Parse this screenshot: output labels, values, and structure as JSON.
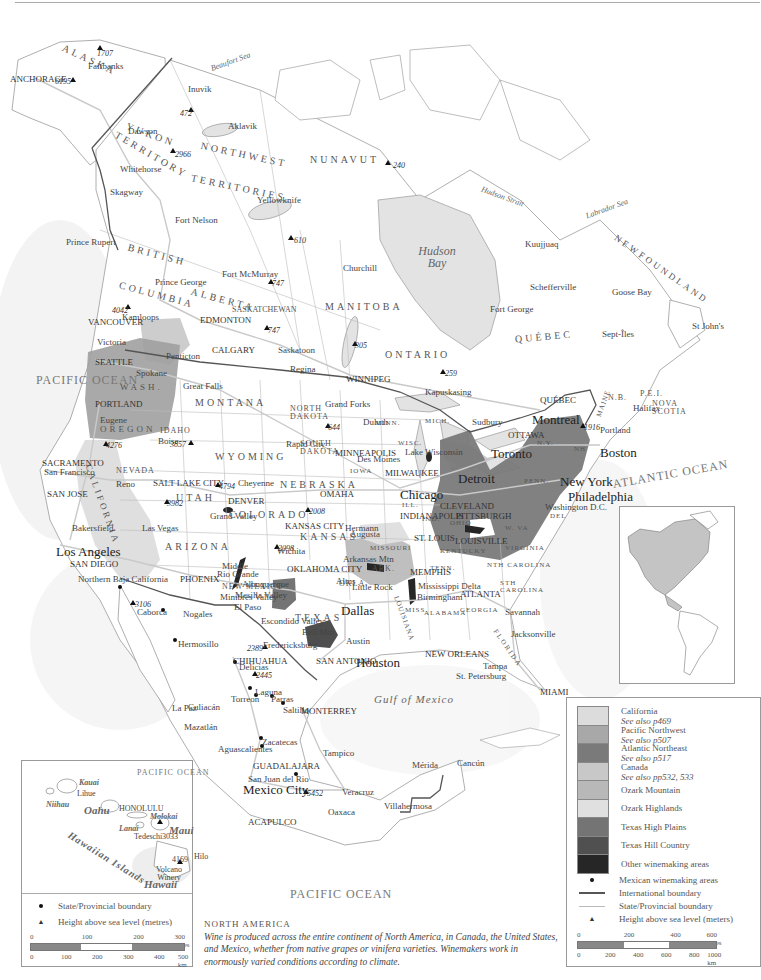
{
  "map": {
    "title": "NORTH AMERICA",
    "description": "Wine is produced across the entire continent of North America, in Canada, the United States, and Mexico, whether from native grapes or vinifera varieties. Winemakers work in enormously varied conditions according to climate."
  },
  "colors": {
    "land": "#ffffff",
    "water": "#e4e4e4",
    "california": "#d9d9d9",
    "pacific_northwest": "#9a9a9a",
    "atlantic_northeast": "#6e6e6e",
    "canada": "#c4c4c4",
    "ozark_mountain": "#b0b0b0",
    "ozark_highlands": "#dadada",
    "texas_high_plains": "#7a7a7a",
    "texas_hill_country": "#4d4d4d",
    "other_winemaking": "#252525",
    "international_boundary": "#555555",
    "state_boundary": "#bbbbbb"
  },
  "oceans": {
    "pacific_north": "PACIFIC OCEAN",
    "pacific_south": "PACIFIC OCEAN",
    "atlantic": "ATLANTIC OCEAN",
    "gulf": "Gulf of Mexico",
    "hudson_bay": "Hudson Bay",
    "beaufort": "Beaufort Sea",
    "labrador": "Labrador Sea",
    "hudson_strait": "Hudson Strait"
  },
  "regions": {
    "alaska": "ALASKA",
    "yukon": "YUKON",
    "yukon_territory": "TERRITORY",
    "northwest": "NORTHWEST",
    "territories": "TERRITORIES",
    "nunavut": "NUNAVUT",
    "british": "BRITISH",
    "columbia": "COLUMBIA",
    "alberta": "ALBERTA",
    "saskatchewan": "SASKATCHEWAN",
    "manitoba": "MANITOBA",
    "ontario": "ONTARIO",
    "quebec": "QUÉBEC",
    "newfoundland": "NEWFOUNDLAND",
    "nb": "N.B.",
    "pei": "P.E.I.",
    "nova_scotia": "NOVA SCOTIA",
    "wash": "WASH.",
    "oregon": "OREGON",
    "idaho": "IDAHO",
    "montana": "MONTANA",
    "wyoming": "WYOMING",
    "nevada": "NEVADA",
    "utah": "UTAH",
    "california": "CALIFORNIA",
    "arizona": "ARIZONA",
    "colorado": "COLORADO",
    "new_mexico": "NEW MEXICO",
    "north_dakota": "NORTH DAKOTA",
    "south_dakota": "SOUTH DAKOTA",
    "nebraska": "NEBRASKA",
    "kansas": "KANSAS",
    "okla": "OKLA.",
    "texas": "TEXAS",
    "minn": "MINN.",
    "iowa": "IOWA",
    "missouri": "MISSOURI",
    "ark": "ARK.",
    "wisc": "WISC.",
    "mich": "MICH.",
    "ill": "ILL.",
    "ind": "IND.",
    "ohio": "OHIO",
    "kentucky": "KENTUCKY",
    "tenn": "TENN.",
    "miss": "MISS.",
    "alabama": "ALABAMA",
    "georgia": "GEORGIA",
    "florida": "FLORIDA",
    "sth_carolina": "STH CAROLINA",
    "nth_carolina": "NTH CAROLINA",
    "virginia": "VIRGINIA",
    "w_va": "W. VA",
    "penn": "PENN.",
    "ny": "N.Y.",
    "maine": "MAINE",
    "nh": "NH",
    "del": "DEL",
    "louisiana": "LOUISIANA",
    "chihuahua": "CHIHUAHUA"
  },
  "cities": [
    {
      "name": "ANCHORAGE",
      "x": 10,
      "y": 75
    },
    {
      "name": "Fairbanks",
      "x": 88,
      "y": 62
    },
    {
      "name": "Inuvik",
      "x": 188,
      "y": 85
    },
    {
      "name": "Aklavik",
      "x": 228,
      "y": 122
    },
    {
      "name": "Dawson",
      "x": 128,
      "y": 127
    },
    {
      "name": "Whitehorse",
      "x": 120,
      "y": 165
    },
    {
      "name": "Skagway",
      "x": 110,
      "y": 188
    },
    {
      "name": "Yellowknife",
      "x": 257,
      "y": 196
    },
    {
      "name": "Fort Nelson",
      "x": 175,
      "y": 216
    },
    {
      "name": "Prince Rupert",
      "x": 66,
      "y": 238
    },
    {
      "name": "Prince George",
      "x": 155,
      "y": 278
    },
    {
      "name": "Fort McMurray",
      "x": 222,
      "y": 270
    },
    {
      "name": "Churchill",
      "x": 343,
      "y": 264
    },
    {
      "name": "Kuujjuaq",
      "x": 525,
      "y": 240
    },
    {
      "name": "Schefferville",
      "x": 530,
      "y": 283
    },
    {
      "name": "Fort George",
      "x": 490,
      "y": 305
    },
    {
      "name": "Goose Bay",
      "x": 612,
      "y": 288
    },
    {
      "name": "Sept-Îles",
      "x": 602,
      "y": 330
    },
    {
      "name": "St John's",
      "x": 692,
      "y": 322
    },
    {
      "name": "Kamloops",
      "x": 122,
      "y": 313
    },
    {
      "name": "VANCOUVER",
      "x": 88,
      "y": 318
    },
    {
      "name": "Victoria",
      "x": 97,
      "y": 338
    },
    {
      "name": "EDMONTON",
      "x": 200,
      "y": 316
    },
    {
      "name": "CALGARY",
      "x": 212,
      "y": 346
    },
    {
      "name": "Saskatoon",
      "x": 278,
      "y": 346
    },
    {
      "name": "Regina",
      "x": 290,
      "y": 365
    },
    {
      "name": "WINNIPEG",
      "x": 346,
      "y": 375
    },
    {
      "name": "Kapuskasing",
      "x": 425,
      "y": 388
    },
    {
      "name": "Sudbury",
      "x": 472,
      "y": 418
    },
    {
      "name": "QUÉBEC",
      "x": 540,
      "y": 396
    },
    {
      "name": "Montreal",
      "x": 532,
      "y": 413
    },
    {
      "name": "OTTAWA",
      "x": 508,
      "y": 431
    },
    {
      "name": "Toronto",
      "x": 491,
      "y": 447
    },
    {
      "name": "Penticton",
      "x": 166,
      "y": 352
    },
    {
      "name": "SEATTLE",
      "x": 95,
      "y": 358
    },
    {
      "name": "Spokane",
      "x": 136,
      "y": 369
    },
    {
      "name": "PORTLAND",
      "x": 95,
      "y": 400
    },
    {
      "name": "Eugene",
      "x": 100,
      "y": 416
    },
    {
      "name": "Great Falls",
      "x": 183,
      "y": 382
    },
    {
      "name": "Grand Forks",
      "x": 325,
      "y": 400
    },
    {
      "name": "Duluth",
      "x": 363,
      "y": 418
    },
    {
      "name": "MINNEAPOLIS",
      "x": 335,
      "y": 449
    },
    {
      "name": "Lake Wisconsin",
      "x": 405,
      "y": 448
    },
    {
      "name": "MILWAUKEE",
      "x": 385,
      "y": 469
    },
    {
      "name": "Detroit",
      "x": 458,
      "y": 472
    },
    {
      "name": "Boston",
      "x": 600,
      "y": 446
    },
    {
      "name": "Portland",
      "x": 600,
      "y": 426
    },
    {
      "name": "New York",
      "x": 560,
      "y": 475
    },
    {
      "name": "Philadelphia",
      "x": 568,
      "y": 490
    },
    {
      "name": "Washington D.C.",
      "x": 545,
      "y": 503
    },
    {
      "name": "Halifax",
      "x": 633,
      "y": 404
    },
    {
      "name": "Boise",
      "x": 158,
      "y": 437
    },
    {
      "name": "SACRAMENTO",
      "x": 42,
      "y": 459
    },
    {
      "name": "San Francisco",
      "x": 44,
      "y": 468
    },
    {
      "name": "SAN JOSE",
      "x": 47,
      "y": 490
    },
    {
      "name": "Reno",
      "x": 116,
      "y": 480
    },
    {
      "name": "SALT LAKE CITY",
      "x": 153,
      "y": 479
    },
    {
      "name": "Cheyenne",
      "x": 238,
      "y": 479
    },
    {
      "name": "DENVER",
      "x": 228,
      "y": 497
    },
    {
      "name": "Grand Valley",
      "x": 210,
      "y": 512
    },
    {
      "name": "Rapid City",
      "x": 286,
      "y": 440
    },
    {
      "name": "Des Moines",
      "x": 357,
      "y": 455
    },
    {
      "name": "OMAHA",
      "x": 320,
      "y": 490
    },
    {
      "name": "Chicago",
      "x": 400,
      "y": 488
    },
    {
      "name": "CLEVELAND",
      "x": 440,
      "y": 502
    },
    {
      "name": "PITTSBURGH",
      "x": 456,
      "y": 512
    },
    {
      "name": "INDIANAPOLIS",
      "x": 400,
      "y": 512
    },
    {
      "name": "Hermann",
      "x": 345,
      "y": 524
    },
    {
      "name": "Augusta",
      "x": 350,
      "y": 530
    },
    {
      "name": "ST. LOUIS",
      "x": 414,
      "y": 534
    },
    {
      "name": "KANSAS CITY",
      "x": 285,
      "y": 522
    },
    {
      "name": "LOUISVILLE",
      "x": 455,
      "y": 537
    },
    {
      "name": "Wichita",
      "x": 277,
      "y": 547
    },
    {
      "name": "Arkansas Mtn",
      "x": 343,
      "y": 555
    },
    {
      "name": "Altus",
      "x": 336,
      "y": 577
    },
    {
      "name": "Little Rock",
      "x": 352,
      "y": 583
    },
    {
      "name": "MEMPHIS",
      "x": 410,
      "y": 568
    },
    {
      "name": "Mississippi Delta",
      "x": 418,
      "y": 582
    },
    {
      "name": "Birmingham",
      "x": 417,
      "y": 593
    },
    {
      "name": "ATLANTA",
      "x": 460,
      "y": 590
    },
    {
      "name": "Savannah",
      "x": 505,
      "y": 608
    },
    {
      "name": "Jacksonville",
      "x": 511,
      "y": 630
    },
    {
      "name": "Tampa",
      "x": 483,
      "y": 662
    },
    {
      "name": "St. Petersburg",
      "x": 456,
      "y": 672
    },
    {
      "name": "MIAMI",
      "x": 540,
      "y": 688
    },
    {
      "name": "OKLAHOMA CITY",
      "x": 287,
      "y": 565
    },
    {
      "name": "Dallas",
      "x": 341,
      "y": 604
    },
    {
      "name": "Austin",
      "x": 346,
      "y": 637
    },
    {
      "name": "SAN ANTONIO",
      "x": 316,
      "y": 657
    },
    {
      "name": "Houston",
      "x": 356,
      "y": 656
    },
    {
      "name": "NEW ORLEANS",
      "x": 425,
      "y": 650
    },
    {
      "name": "Bell Mtn",
      "x": 302,
      "y": 628
    },
    {
      "name": "Fredericksburg",
      "x": 263,
      "y": 641
    },
    {
      "name": "Escondido Valley",
      "x": 261,
      "y": 617
    },
    {
      "name": "El Paso",
      "x": 234,
      "y": 603
    },
    {
      "name": "Mesilla Valley",
      "x": 235,
      "y": 591
    },
    {
      "name": "Mimbres Valley",
      "x": 220,
      "y": 593
    },
    {
      "name": "Rio Grande",
      "x": 217,
      "y": 570
    },
    {
      "name": "Middle",
      "x": 222,
      "y": 562
    },
    {
      "name": "Albuquerque",
      "x": 242,
      "y": 580
    },
    {
      "name": "PHOENIX",
      "x": 180,
      "y": 575
    },
    {
      "name": "Las Vegas",
      "x": 142,
      "y": 524
    },
    {
      "name": "Los Angeles",
      "x": 56,
      "y": 545
    },
    {
      "name": "SAN DIEGO",
      "x": 70,
      "y": 560
    },
    {
      "name": "Bakersfield",
      "x": 72,
      "y": 524
    },
    {
      "name": "Northern Baja California",
      "x": 78,
      "y": 575
    },
    {
      "name": "Caborca",
      "x": 137,
      "y": 608
    },
    {
      "name": "Nogales",
      "x": 183,
      "y": 610
    },
    {
      "name": "Hermosillo",
      "x": 178,
      "y": 640
    },
    {
      "name": "CHIHUAHUA",
      "x": 233,
      "y": 657
    },
    {
      "name": "Delicias",
      "x": 239,
      "y": 663
    },
    {
      "name": "Laguna",
      "x": 255,
      "y": 688
    },
    {
      "name": "Torreon",
      "x": 231,
      "y": 695
    },
    {
      "name": "Parras",
      "x": 271,
      "y": 695
    },
    {
      "name": "Saltillo",
      "x": 283,
      "y": 706
    },
    {
      "name": "MONTERREY",
      "x": 301,
      "y": 707
    },
    {
      "name": "Culiacán",
      "x": 188,
      "y": 703
    },
    {
      "name": "La Paz",
      "x": 172,
      "y": 704
    },
    {
      "name": "Mazatlán",
      "x": 184,
      "y": 723
    },
    {
      "name": "Zacatecas",
      "x": 262,
      "y": 738
    },
    {
      "name": "Aguascalientes",
      "x": 218,
      "y": 745
    },
    {
      "name": "Tampico",
      "x": 323,
      "y": 749
    },
    {
      "name": "GUADALAJARA",
      "x": 253,
      "y": 762
    },
    {
      "name": "San Juan del Rio",
      "x": 248,
      "y": 775
    },
    {
      "name": "Mexico City",
      "x": 243,
      "y": 783
    },
    {
      "name": "Veracruz",
      "x": 342,
      "y": 788
    },
    {
      "name": "Oaxaca",
      "x": 328,
      "y": 808
    },
    {
      "name": "Villahermosa",
      "x": 384,
      "y": 802
    },
    {
      "name": "Mérida",
      "x": 412,
      "y": 761
    },
    {
      "name": "Cancún",
      "x": 457,
      "y": 759
    },
    {
      "name": "ACAPULCO",
      "x": 248,
      "y": 818
    }
  ],
  "peaks": [
    {
      "label": "1707",
      "x": 97,
      "y": 50
    },
    {
      "label": "6195",
      "x": 55,
      "y": 78
    },
    {
      "label": "472",
      "x": 180,
      "y": 110
    },
    {
      "label": "2966",
      "x": 175,
      "y": 151
    },
    {
      "label": "240",
      "x": 393,
      "y": 162
    },
    {
      "label": "610",
      "x": 294,
      "y": 237
    },
    {
      "label": "747",
      "x": 272,
      "y": 280
    },
    {
      "label": "747",
      "x": 268,
      "y": 327
    },
    {
      "label": "305",
      "x": 355,
      "y": 342
    },
    {
      "label": "259",
      "x": 445,
      "y": 370
    },
    {
      "label": "1916",
      "x": 584,
      "y": 424
    },
    {
      "label": "4042",
      "x": 112,
      "y": 307
    },
    {
      "label": "3857",
      "x": 170,
      "y": 441
    },
    {
      "label": "4276",
      "x": 106,
      "y": 442
    },
    {
      "label": "644",
      "x": 328,
      "y": 424
    },
    {
      "label": "3982",
      "x": 167,
      "y": 500
    },
    {
      "label": "2008",
      "x": 309,
      "y": 508
    },
    {
      "label": "4794",
      "x": 219,
      "y": 483
    },
    {
      "label": "2098",
      "x": 278,
      "y": 545
    },
    {
      "label": "3106",
      "x": 135,
      "y": 601
    },
    {
      "label": "2389",
      "x": 247,
      "y": 645
    },
    {
      "label": "2445",
      "x": 256,
      "y": 672
    },
    {
      "label": "5452",
      "x": 307,
      "y": 790
    }
  ],
  "legend": {
    "items": [
      {
        "label": "California",
        "sub": "See also p469",
        "color": "#dcdcdc"
      },
      {
        "label": "Pacific Northwest",
        "sub": "See also p507",
        "color": "#a8a8a8"
      },
      {
        "label": "Atlantic Northeast",
        "sub": "See also p517",
        "color": "#7a7a7a"
      },
      {
        "label": "Canada",
        "sub": "See also pp532, 533",
        "color": "#c8c8c8"
      },
      {
        "label": "Ozark Mountain",
        "sub": "",
        "color": "#b8b8b8"
      },
      {
        "label": "Ozark Highlands",
        "sub": "",
        "color": "#e0e0e0"
      },
      {
        "label": "Texas High Plains",
        "sub": "",
        "color": "#747474"
      },
      {
        "label": "Texas Hill Country",
        "sub": "",
        "color": "#505050"
      },
      {
        "label": "Other winemaking areas",
        "sub": "",
        "color": "#262626"
      }
    ],
    "symbols": {
      "mexican": "Mexican winemaking areas",
      "international": "International boundary",
      "state": "State/Provincial boundary",
      "height": "Height above sea level (meters)"
    },
    "scale": {
      "miles": [
        "0",
        "200",
        "400",
        "600 miles"
      ],
      "km": [
        "0",
        "200",
        "400",
        "600",
        "800",
        "1000 km"
      ]
    }
  },
  "hawaii_inset": {
    "ocean": "PACIFIC OCEAN",
    "chain": "Hawaiian Islands",
    "islands": [
      {
        "name": "Kauai",
        "x": 57,
        "y": 18,
        "bold": true
      },
      {
        "name": "Niihau",
        "x": 24,
        "y": 40,
        "bold": true
      },
      {
        "name": "Oahu",
        "x": 62,
        "y": 44,
        "bold": true,
        "big": true
      },
      {
        "name": "Molokai",
        "x": 128,
        "y": 52,
        "bold": true
      },
      {
        "name": "Lanai",
        "x": 97,
        "y": 64,
        "bold": true
      },
      {
        "name": "Maui",
        "x": 147,
        "y": 64,
        "bold": true,
        "big": true
      },
      {
        "name": "Hawaii",
        "x": 122,
        "y": 118,
        "bold": true,
        "big": true
      }
    ],
    "places": [
      {
        "name": "Lihue",
        "x": 55,
        "y": 29
      },
      {
        "name": "HONOLULU",
        "x": 97,
        "y": 44
      },
      {
        "name": "Tedeschi",
        "x": 112,
        "y": 72
      },
      {
        "name": "3033",
        "x": 140,
        "y": 72
      },
      {
        "name": "Hilo",
        "x": 172,
        "y": 92
      },
      {
        "name": "4169",
        "x": 150,
        "y": 95
      },
      {
        "name": "Volcano Winery",
        "x": 130,
        "y": 105
      }
    ],
    "legend": {
      "state": "State/Provincial boundary",
      "height": "Height above sea level (metres)"
    },
    "scale": {
      "miles": [
        "0",
        "100",
        "200",
        "300 miles"
      ],
      "km": [
        "0",
        "100",
        "200",
        "300",
        "400",
        "500 km"
      ]
    }
  }
}
